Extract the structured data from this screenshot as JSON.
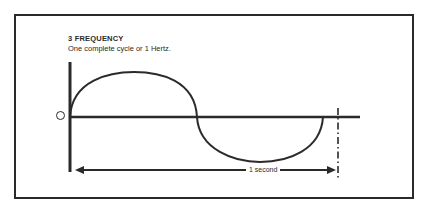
{
  "diagram": {
    "title": "3 FREQUENCY",
    "subtitle": "One complete cycle or 1 Hertz.",
    "zero_label": "O",
    "duration_label": "1 second",
    "colors": {
      "ink": "#2a2a2a",
      "background": "#ffffff"
    },
    "elements": [
      "vertical-axis",
      "horizontal-axis",
      "sine-positive-half",
      "sine-negative-half",
      "period-end-dashdot-marker",
      "duration-arrow"
    ]
  }
}
